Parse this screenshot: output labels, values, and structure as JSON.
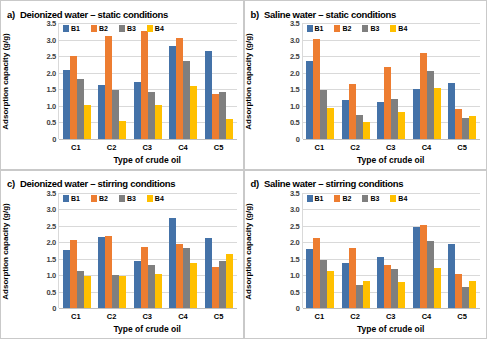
{
  "figure": {
    "background": "#ffffff",
    "series_colors": {
      "B1": "#4472a8",
      "B2": "#ed7d31",
      "B3": "#7f7f7f",
      "B4": "#ffc000"
    },
    "axis": {
      "ylabel": "Adsorption capacity (g/g)",
      "xlabel": "Type of crude oil",
      "yticks": [
        "0",
        "0.5",
        "1.0",
        "1.5",
        "2.0",
        "2.5",
        "3.0",
        "3.5"
      ],
      "ymin": 0,
      "ymax": 3.5,
      "categories": [
        "C1",
        "C2",
        "C3",
        "C4",
        "C5"
      ],
      "legend": [
        "B1",
        "B2",
        "B3",
        "B4"
      ]
    },
    "panels": [
      {
        "letter": "a)",
        "title": "Deionized water – static conditions"
      },
      {
        "letter": "b)",
        "title": "Saline water – static conditions"
      },
      {
        "letter": "c)",
        "title": "Deionized water – stirring conditions"
      },
      {
        "letter": "d)",
        "title": "Saline water – stirring conditions"
      }
    ]
  },
  "chart_data": [
    {
      "type": "bar",
      "title": "a) Deionized water – static conditions",
      "xlabel": "Type of crude oil",
      "ylabel": "Adsorption capacity (g/g)",
      "ylim": [
        0,
        3.5
      ],
      "yticks": [
        0,
        0.5,
        1.0,
        1.5,
        2.0,
        2.5,
        3.0,
        3.5
      ],
      "grid": true,
      "legend_position": "top-left-inside",
      "categories": [
        "C1",
        "C2",
        "C3",
        "C4",
        "C5"
      ],
      "series": [
        {
          "name": "B1",
          "color": "#4472a8",
          "values": [
            2.08,
            1.63,
            1.72,
            2.8,
            2.66
          ]
        },
        {
          "name": "B2",
          "color": "#ed7d31",
          "values": [
            2.49,
            3.11,
            3.26,
            3.05,
            1.34
          ]
        },
        {
          "name": "B3",
          "color": "#7f7f7f",
          "values": [
            1.79,
            1.48,
            1.4,
            2.34,
            1.4
          ]
        },
        {
          "name": "B4",
          "color": "#ffc000",
          "values": [
            1.01,
            0.53,
            1.03,
            1.59,
            0.58
          ]
        }
      ]
    },
    {
      "type": "bar",
      "title": "b) Saline water – static conditions",
      "xlabel": "Type of crude oil",
      "ylabel": "Adsorption capacity (g/g)",
      "ylim": [
        0,
        3.5
      ],
      "yticks": [
        0,
        0.5,
        1.0,
        1.5,
        2.0,
        2.5,
        3.0,
        3.5
      ],
      "grid": true,
      "legend_position": "top-left-inside",
      "categories": [
        "C1",
        "C2",
        "C3",
        "C4",
        "C5"
      ],
      "series": [
        {
          "name": "B1",
          "color": "#4472a8",
          "values": [
            2.36,
            1.18,
            1.12,
            1.5,
            1.67
          ]
        },
        {
          "name": "B2",
          "color": "#ed7d31",
          "values": [
            3.02,
            1.64,
            2.16,
            2.6,
            0.88
          ]
        },
        {
          "name": "B3",
          "color": "#7f7f7f",
          "values": [
            1.46,
            0.72,
            1.19,
            2.05,
            0.63
          ]
        },
        {
          "name": "B4",
          "color": "#ffc000",
          "values": [
            0.93,
            0.5,
            0.79,
            1.53,
            0.69
          ]
        }
      ]
    },
    {
      "type": "bar",
      "title": "c) Deionized water – stirring conditions",
      "xlabel": "Type of crude oil",
      "ylabel": "Adsorption capacity (g/g)",
      "ylim": [
        0,
        3.5
      ],
      "yticks": [
        0,
        0.5,
        1.0,
        1.5,
        2.0,
        2.5,
        3.0,
        3.5
      ],
      "grid": true,
      "legend_position": "top-left-inside",
      "categories": [
        "C1",
        "C2",
        "C3",
        "C4",
        "C5"
      ],
      "series": [
        {
          "name": "B1",
          "color": "#4472a8",
          "values": [
            1.77,
            2.14,
            1.43,
            2.74,
            2.13
          ]
        },
        {
          "name": "B2",
          "color": "#ed7d31",
          "values": [
            2.07,
            2.19,
            1.84,
            1.93,
            1.23
          ]
        },
        {
          "name": "B3",
          "color": "#7f7f7f",
          "values": [
            1.13,
            0.99,
            1.29,
            1.81,
            1.43
          ]
        },
        {
          "name": "B4",
          "color": "#ffc000",
          "values": [
            0.98,
            0.98,
            1.04,
            1.36,
            1.64
          ]
        }
      ]
    },
    {
      "type": "bar",
      "title": "d) Saline water – stirring conditions",
      "xlabel": "Type of crude oil",
      "ylabel": "Adsorption capacity (g/g)",
      "ylim": [
        0,
        3.5
      ],
      "yticks": [
        0,
        0.5,
        1.0,
        1.5,
        2.0,
        2.5,
        3.0,
        3.5
      ],
      "grid": true,
      "legend_position": "top-left-inside",
      "categories": [
        "C1",
        "C2",
        "C3",
        "C4",
        "C5"
      ],
      "series": [
        {
          "name": "B1",
          "color": "#4472a8",
          "values": [
            1.78,
            1.36,
            1.55,
            2.47,
            1.93
          ]
        },
        {
          "name": "B2",
          "color": "#ed7d31",
          "values": [
            2.13,
            1.82,
            1.29,
            2.52,
            1.04
          ]
        },
        {
          "name": "B3",
          "color": "#7f7f7f",
          "values": [
            1.46,
            0.69,
            1.18,
            2.04,
            0.63
          ]
        },
        {
          "name": "B4",
          "color": "#ffc000",
          "values": [
            1.11,
            0.83,
            0.78,
            1.22,
            0.81
          ]
        }
      ]
    }
  ]
}
